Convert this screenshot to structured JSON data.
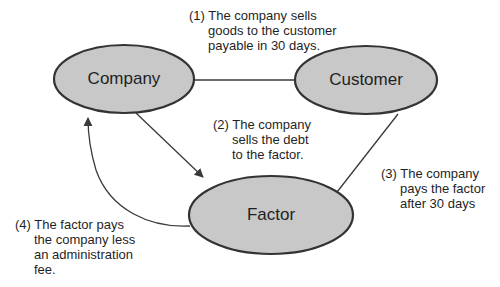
{
  "diagram": {
    "title": "",
    "colors": {
      "node_fill": "#c8c8c8",
      "node_stroke": "#333333",
      "arrow": "#3a3a3a",
      "background": "#ffffff"
    },
    "nodes": [
      {
        "id": "company",
        "label": "Company"
      },
      {
        "id": "customer",
        "label": "Customer"
      },
      {
        "id": "factor",
        "label": "Factor"
      }
    ],
    "edges": [
      {
        "id": "step1",
        "from": "company",
        "to": "customer",
        "number": "(1)",
        "lines": [
          "The company sells",
          "goods to the customer",
          "payable in 30 days."
        ]
      },
      {
        "id": "step2",
        "from": "company",
        "to": "factor",
        "number": "(2)",
        "lines": [
          "The company",
          "sells the debt",
          "to the factor."
        ]
      },
      {
        "id": "step3",
        "from": "customer",
        "to": "factor",
        "number": "(3)",
        "lines": [
          "The company",
          "pays the factor",
          "after 30 days"
        ]
      },
      {
        "id": "step4",
        "from": "factor",
        "to": "company",
        "number": "(4)",
        "lines": [
          "The factor pays",
          "the company less",
          "an administration",
          "fee."
        ]
      }
    ]
  }
}
